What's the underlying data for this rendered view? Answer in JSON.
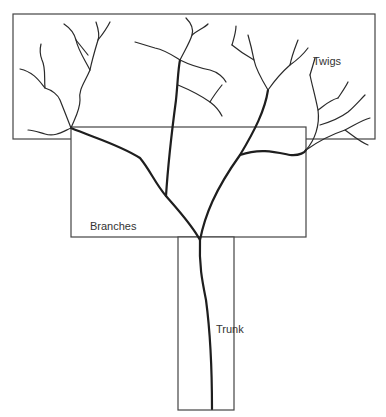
{
  "diagram": {
    "type": "tree-hierarchy",
    "regions": [
      {
        "id": "twigs",
        "label": "Twigs"
      },
      {
        "id": "branches",
        "label": "Branches"
      },
      {
        "id": "trunk",
        "label": "Trunk"
      }
    ],
    "colors": {
      "line": "#2a2a2a",
      "box": "#444444",
      "text": "#333333"
    }
  }
}
